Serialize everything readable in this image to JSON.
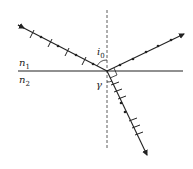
{
  "diagram": {
    "type": "physics-optics",
    "labels": {
      "n1": "n",
      "n1_sub": "1",
      "n2": "n",
      "n2_sub": "2",
      "incident_angle": "i",
      "incident_angle_sub": "0",
      "refraction_angle": "γ"
    },
    "rays": [
      {
        "name": "incident",
        "polarization": "dots-and-lines (mixed)"
      },
      {
        "name": "reflected",
        "polarization": "dots (s-polarized)"
      },
      {
        "name": "refracted",
        "polarization": "dots-and-lines (partially polarized)"
      }
    ],
    "annotations": [
      "normal (dashed)",
      "interface",
      "right angle between reflected and refracted rays"
    ],
    "colors": {
      "line": "#222222",
      "background": "#ffffff"
    }
  }
}
